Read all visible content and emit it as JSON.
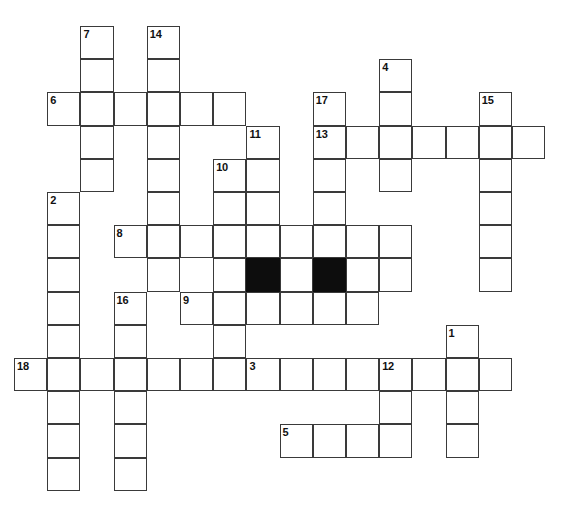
{
  "puzzle": {
    "title": "Crossword Grid",
    "type": "crossword-grid",
    "grid": {
      "origin_x": 14,
      "origin_y": 26,
      "cell_size": 33.2,
      "columns": 17,
      "rows": 14,
      "line_color": "#3a3a3a",
      "cell_fill": "#ffffff",
      "blocked_fill": "#0d0d0d",
      "background": "#ffffff"
    },
    "entries": [
      {
        "number": "7",
        "direction": "down",
        "col": 2,
        "row": 0,
        "length": 5
      },
      {
        "number": "14",
        "direction": "down",
        "col": 4,
        "row": 0,
        "length": 7
      },
      {
        "number": "4",
        "direction": "down",
        "col": 11,
        "row": 1,
        "length": 5
      },
      {
        "number": "6",
        "direction": "across",
        "col": 1,
        "row": 2,
        "length": 6
      },
      {
        "number": "17",
        "direction": "down",
        "col": 9,
        "row": 2,
        "length": 5
      },
      {
        "number": "15",
        "direction": "down",
        "col": 14,
        "row": 2,
        "length": 6
      },
      {
        "number": "13",
        "direction": "across",
        "col": 9,
        "row": 3,
        "length": 7
      },
      {
        "number": "11",
        "direction": "down",
        "col": 7,
        "row": 3,
        "length": 5
      },
      {
        "number": "10",
        "direction": "down",
        "col": 6,
        "row": 4,
        "length": 6
      },
      {
        "number": "2",
        "direction": "down",
        "col": 1,
        "row": 5,
        "length": 9
      },
      {
        "number": "8",
        "direction": "across",
        "col": 3,
        "row": 6,
        "length": 9
      },
      {
        "number": "16",
        "direction": "down",
        "col": 3,
        "row": 8,
        "length": 6
      },
      {
        "number": "9",
        "direction": "across",
        "col": 5,
        "row": 8,
        "length": 6
      },
      {
        "number": "1",
        "direction": "down",
        "col": 13,
        "row": 9,
        "length": 5
      },
      {
        "number": "18",
        "direction": "across",
        "col": 0,
        "row": 10,
        "length": 7
      },
      {
        "number": "3",
        "direction": "across",
        "col": 7,
        "row": 10,
        "length": 8
      },
      {
        "number": "12",
        "direction": "down",
        "col": 11,
        "row": 10,
        "length": 4
      },
      {
        "number": "5",
        "direction": "across",
        "col": 8,
        "row": 12,
        "length": 4
      }
    ],
    "open_cells": [
      [
        2,
        0
      ],
      [
        4,
        0
      ],
      [
        2,
        1
      ],
      [
        4,
        1
      ],
      [
        11,
        1
      ],
      [
        1,
        2
      ],
      [
        2,
        2
      ],
      [
        3,
        2
      ],
      [
        4,
        2
      ],
      [
        5,
        2
      ],
      [
        6,
        2
      ],
      [
        9,
        2
      ],
      [
        11,
        2
      ],
      [
        14,
        2
      ],
      [
        2,
        3
      ],
      [
        4,
        3
      ],
      [
        7,
        3
      ],
      [
        9,
        3
      ],
      [
        10,
        3
      ],
      [
        11,
        3
      ],
      [
        12,
        3
      ],
      [
        13,
        3
      ],
      [
        14,
        3
      ],
      [
        15,
        3
      ],
      [
        2,
        4
      ],
      [
        4,
        4
      ],
      [
        6,
        4
      ],
      [
        7,
        4
      ],
      [
        9,
        4
      ],
      [
        11,
        4
      ],
      [
        14,
        4
      ],
      [
        1,
        5
      ],
      [
        4,
        5
      ],
      [
        6,
        5
      ],
      [
        7,
        5
      ],
      [
        9,
        5
      ],
      [
        14,
        5
      ],
      [
        1,
        6
      ],
      [
        3,
        6
      ],
      [
        4,
        6
      ],
      [
        5,
        6
      ],
      [
        6,
        6
      ],
      [
        7,
        6
      ],
      [
        8,
        6
      ],
      [
        9,
        6
      ],
      [
        10,
        6
      ],
      [
        11,
        6
      ],
      [
        14,
        6
      ],
      [
        1,
        7
      ],
      [
        4,
        7
      ],
      [
        6,
        7
      ],
      [
        8,
        7
      ],
      [
        10,
        7
      ],
      [
        11,
        7
      ],
      [
        14,
        7
      ],
      [
        1,
        8
      ],
      [
        3,
        8
      ],
      [
        5,
        8
      ],
      [
        6,
        8
      ],
      [
        7,
        8
      ],
      [
        8,
        8
      ],
      [
        9,
        8
      ],
      [
        10,
        8
      ],
      [
        1,
        9
      ],
      [
        3,
        9
      ],
      [
        6,
        9
      ],
      [
        13,
        9
      ],
      [
        0,
        10
      ],
      [
        1,
        10
      ],
      [
        2,
        10
      ],
      [
        3,
        10
      ],
      [
        4,
        10
      ],
      [
        5,
        10
      ],
      [
        6,
        10
      ],
      [
        7,
        10
      ],
      [
        8,
        10
      ],
      [
        9,
        10
      ],
      [
        10,
        10
      ],
      [
        11,
        10
      ],
      [
        12,
        10
      ],
      [
        13,
        10
      ],
      [
        14,
        10
      ],
      [
        1,
        11
      ],
      [
        3,
        11
      ],
      [
        11,
        11
      ],
      [
        13,
        11
      ],
      [
        1,
        12
      ],
      [
        3,
        12
      ],
      [
        8,
        12
      ],
      [
        9,
        12
      ],
      [
        10,
        12
      ],
      [
        11,
        12
      ],
      [
        13,
        12
      ],
      [
        1,
        13
      ],
      [
        3,
        13
      ]
    ],
    "blocked_cells": [
      [
        7,
        7
      ],
      [
        9,
        7
      ]
    ]
  }
}
